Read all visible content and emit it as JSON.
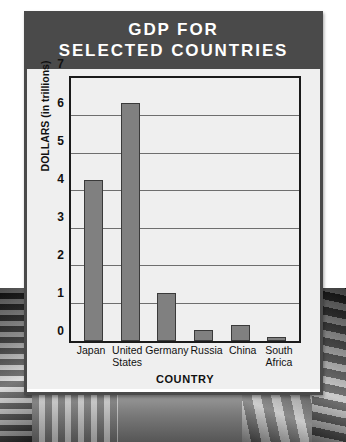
{
  "page": {
    "top_fragment": "",
    "background": "grayscale-photograph"
  },
  "card": {
    "title_line1": "GDP FOR",
    "title_line2": "SELECTED COUNTRIES",
    "header_color": "#4a4a4a",
    "body_color": "#efefef",
    "bar_color": "#808080"
  },
  "chart_data": {
    "type": "bar",
    "title": "GDP FOR SELECTED COUNTRIES",
    "xlabel": "COUNTRY",
    "ylabel": "DOLLARS (in trillions)",
    "categories": [
      "Japan",
      "United States",
      "Germany",
      "Russia",
      "China",
      "South Africa"
    ],
    "category_lines": [
      [
        "Japan"
      ],
      [
        "United",
        "States"
      ],
      [
        "Germany"
      ],
      [
        "Russia"
      ],
      [
        "China"
      ],
      [
        "South",
        "Africa"
      ]
    ],
    "values": [
      4.3,
      6.35,
      1.3,
      0.3,
      0.43,
      0.13
    ],
    "ylim": [
      0,
      7
    ],
    "yticks": [
      0,
      1,
      2,
      3,
      4,
      5,
      6,
      7
    ],
    "ytick_labels": [
      "0",
      "1",
      "2",
      "3",
      "4",
      "5",
      "6",
      "7"
    ],
    "grid": true,
    "legend": "none",
    "bar_color": "#808080",
    "series": [
      {
        "name": "GDP",
        "values": [
          4.3,
          6.35,
          1.3,
          0.3,
          0.43,
          0.13
        ]
      }
    ]
  }
}
